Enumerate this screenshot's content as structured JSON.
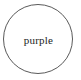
{
  "diagram": {
    "background_color": "#ffffff",
    "shape": {
      "type": "circle",
      "stroke_color": "#5a5a5a",
      "fill_color": "none",
      "label": "purple",
      "label_color": "#1c1c1c"
    }
  }
}
